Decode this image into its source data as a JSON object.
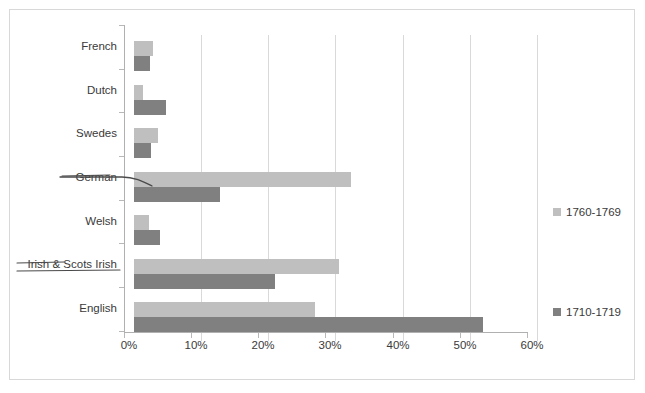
{
  "chart_data": {
    "type": "bar",
    "orientation": "horizontal",
    "title": "",
    "xlabel": "",
    "ylabel": "",
    "xlim": [
      0,
      60
    ],
    "xticks": [
      "0%",
      "10%",
      "20%",
      "30%",
      "40%",
      "50%",
      "60%"
    ],
    "xtick_values": [
      0,
      10,
      20,
      30,
      40,
      50,
      60
    ],
    "grid": true,
    "legend_position": "right",
    "categories": [
      "French",
      "Dutch",
      "Swedes",
      "German",
      "Welsh",
      "Irish & Scots Irish",
      "English"
    ],
    "series": [
      {
        "name": "1760-1769",
        "color": "#bfbfbf",
        "values": [
          2.8,
          1.3,
          3.6,
          32.3,
          2.2,
          30.5,
          27.0
        ]
      },
      {
        "name": "1710-1719",
        "color": "#808080",
        "values": [
          2.4,
          4.8,
          2.5,
          12.8,
          3.8,
          21.0,
          52.0
        ]
      }
    ]
  },
  "legend": {
    "entries": [
      {
        "label": "1760-1769",
        "color": "#bfbfbf"
      },
      {
        "label": "1710-1719",
        "color": "#808080"
      }
    ]
  },
  "annotations": [
    {
      "name": "german-pointer",
      "target": "German",
      "type": "hand-drawn-arrow"
    },
    {
      "name": "irish-underline",
      "target": "Irish & Scots Irish",
      "type": "hand-drawn-underline"
    }
  ],
  "colors": {
    "series_1760": "#bfbfbf",
    "series_1710": "#808080",
    "gridline": "#d9d9d9",
    "axis": "#b0b0b0",
    "text": "#3a3a3a",
    "frame": "#d8d8d8",
    "background": "#ffffff"
  }
}
